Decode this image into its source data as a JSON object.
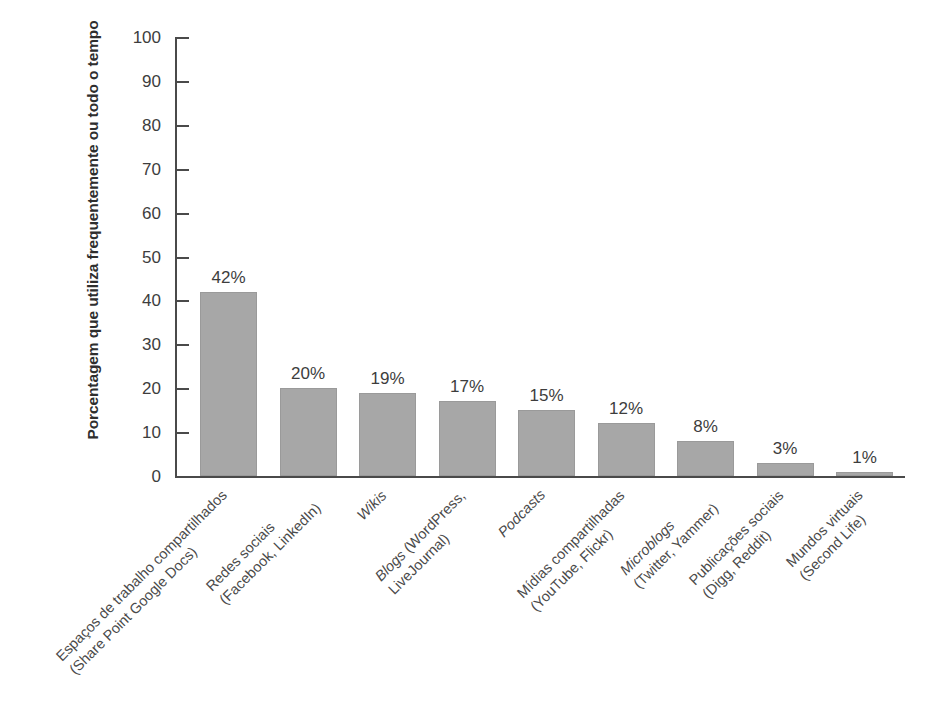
{
  "chart_data": {
    "type": "bar",
    "title": "",
    "xlabel": "",
    "ylabel": "Porcentagem que utiliza frequentemente ou todo o tempo",
    "ylim": [
      0,
      100
    ],
    "ytick_labels": [
      "100",
      "90",
      "80",
      "70",
      "60",
      "50",
      "40",
      "30",
      "20",
      "10",
      "0"
    ],
    "ytick_values": [
      100,
      90,
      80,
      70,
      60,
      50,
      40,
      30,
      20,
      10,
      0
    ],
    "grid": false,
    "legend": "none",
    "bar_color": "#a7a7a7",
    "categories": [
      "Espaços de trabalho compartilhados (Share Point Google Docs)",
      "Redes sociais (Facebook, LinkedIn)",
      "Wikis",
      "Blogs (WordPress, LiveJournal)",
      "Podcasts",
      "Mídias compartilhadas (YouTube, Flickr)",
      "Microblogs (Twitter, Yammer)",
      "Publicações sociais (Digg, Reddit)",
      "Mundos virtuais (Second Life)"
    ],
    "category_lines": [
      {
        "line1": "Espaços de trabalho compartilhados",
        "line2": "(Share Point Google Docs)",
        "italic_line1": false
      },
      {
        "line1": "Redes sociais",
        "line2": "(Facebook, LinkedIn)",
        "italic_line1": false
      },
      {
        "line1": "Wikis",
        "line2": "",
        "italic_line1": true
      },
      {
        "line1": "Blogs (WordPress,",
        "line2": "LiveJournal)",
        "italic_line1": false,
        "italic_word": "Blogs"
      },
      {
        "line1": "Podcasts",
        "line2": "",
        "italic_line1": true
      },
      {
        "line1": "Mídias compartilhadas",
        "line2": "(YouTube, Flickr)",
        "italic_line1": false
      },
      {
        "line1": "Microblogs",
        "line2": "(Twitter, Yammer)",
        "italic_line1": true
      },
      {
        "line1": "Publicações sociais",
        "line2": "(Digg, Reddit)",
        "italic_line1": false
      },
      {
        "line1": "Mundos virtuais",
        "line2": "(Second Life)",
        "italic_line1": false
      }
    ],
    "values": [
      42,
      20,
      19,
      17,
      15,
      12,
      8,
      3,
      1
    ],
    "value_labels": [
      "42%",
      "20%",
      "19%",
      "17%",
      "15%",
      "12%",
      "8%",
      "3%",
      "1%"
    ]
  }
}
